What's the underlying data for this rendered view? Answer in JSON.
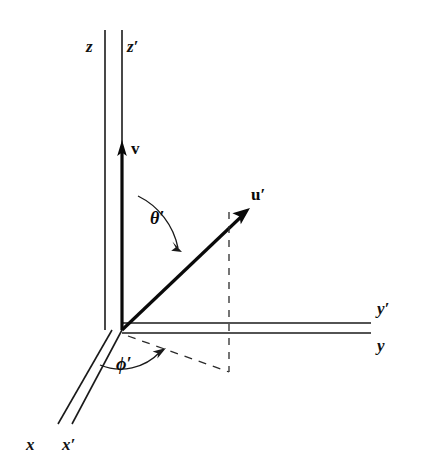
{
  "figure": {
    "background_color": "#ffffff",
    "stroke_color": "#1a1a1a",
    "axes": [
      {
        "id": "z",
        "label": "z",
        "label_x": 86,
        "label_y": 38
      },
      {
        "id": "zp",
        "label": "z′",
        "label_x": 127,
        "label_y": 38
      },
      {
        "id": "y",
        "label": "y",
        "label_x": 377,
        "label_y": 337
      },
      {
        "id": "yp",
        "label": "y′",
        "label_x": 377,
        "label_y": 300
      },
      {
        "id": "x",
        "label": "x",
        "label_x": 26,
        "label_y": 436
      },
      {
        "id": "xp",
        "label": "x′",
        "label_x": 62,
        "label_y": 436
      }
    ],
    "vectors": [
      {
        "id": "v",
        "label": "v",
        "label_x": 131,
        "label_y": 140,
        "tip_x": 122,
        "tip_y": 143,
        "tail_x": 122,
        "tail_y": 330
      },
      {
        "id": "up",
        "label": "u′",
        "label_x": 251,
        "label_y": 186,
        "tip_x": 248,
        "tip_y": 209,
        "tail_x": 122,
        "tail_y": 330
      }
    ],
    "angles": [
      {
        "id": "theta-prime",
        "label": "θ′",
        "label_x": 150,
        "label_y": 209
      },
      {
        "id": "phi-prime",
        "label": "ϕ′",
        "label_x": 116,
        "label_y": 355
      }
    ],
    "dashed_lines": [
      {
        "id": "u-vertical-projection",
        "x1": 229,
        "y1": 212,
        "x2": 229,
        "y2": 372
      },
      {
        "id": "xy-plane-projection",
        "x1": 128,
        "y1": 336,
        "x2": 229,
        "y2": 372
      }
    ]
  }
}
